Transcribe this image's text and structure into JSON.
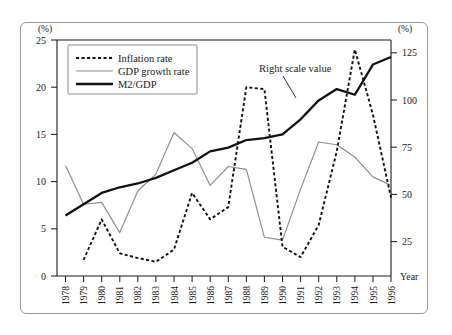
{
  "chart_data": {
    "type": "line",
    "title": "",
    "xlabel": "Year",
    "ylabel_left": "(%)",
    "ylabel_right": "(%)",
    "grid": false,
    "legend_position": "top-left",
    "x": [
      1978,
      1979,
      1980,
      1981,
      1982,
      1983,
      1984,
      1985,
      1986,
      1987,
      1988,
      1989,
      1990,
      1991,
      1992,
      1993,
      1994,
      1995,
      1996
    ],
    "categories": [
      "1978",
      "1979",
      "1980",
      "1981",
      "1982",
      "1983",
      "1984",
      "1985",
      "1986",
      "1987",
      "1988",
      "1989",
      "1990",
      "1991",
      "1992",
      "1993",
      "1994",
      "1995",
      "1996"
    ],
    "ylim_left": [
      0,
      25
    ],
    "ylim_right": [
      0,
      125
    ],
    "yticks_left": [
      0,
      5,
      10,
      15,
      20,
      25
    ],
    "yticks_right": [
      0,
      25,
      50,
      75,
      100,
      125
    ],
    "series": [
      {
        "name": "Inflation rate",
        "axis": "left",
        "style": "dotted",
        "color": "#111111",
        "values": [
          null,
          1.7,
          6.0,
          2.4,
          1.9,
          1.5,
          2.8,
          8.8,
          6.0,
          7.3,
          20.0,
          19.8,
          3.1,
          2.0,
          5.4,
          13.2,
          24.0,
          17.1,
          8.3
        ]
      },
      {
        "name": "GDP growth rate",
        "axis": "left",
        "style": "thin-solid",
        "color": "#8c8c8c",
        "values": [
          11.7,
          7.6,
          7.8,
          4.6,
          9.0,
          10.8,
          15.2,
          13.5,
          9.6,
          11.6,
          11.3,
          4.1,
          3.8,
          9.2,
          14.2,
          13.9,
          12.6,
          10.5,
          9.6
        ]
      },
      {
        "name": "M2/GDP",
        "axis": "right",
        "style": "thick-solid",
        "color": "#111111",
        "values": [
          32,
          38,
          44,
          47,
          49,
          52,
          56,
          60,
          66,
          68,
          72,
          73,
          75,
          83,
          93,
          99,
          96,
          112,
          116
        ]
      }
    ],
    "annotations": [
      {
        "text": "Right scale value",
        "points_to_series": "M2/GDP",
        "points_to_x": 1990
      }
    ]
  },
  "axes": {
    "left_unit": "(%)",
    "right_unit": "(%)",
    "x_axis_label": "Year",
    "left_ticks": [
      "25",
      "20",
      "15",
      "10",
      "5",
      "0"
    ],
    "right_ticks": [
      "125",
      "100",
      "75",
      "50",
      "25"
    ],
    "year_labels": [
      "1978",
      "1979",
      "1980",
      "1981",
      "1982",
      "1983",
      "1984",
      "1985",
      "1986",
      "1987",
      "1988",
      "1989",
      "1990",
      "1991",
      "1992",
      "1993",
      "1994",
      "1995",
      "1996"
    ]
  },
  "legend": {
    "items": [
      {
        "label": "Inflation rate",
        "style": "dotted"
      },
      {
        "label": "GDP growth rate",
        "style": "thin-solid"
      },
      {
        "label": "M2/GDP",
        "style": "thick-solid"
      }
    ]
  },
  "annotation": {
    "right_scale_value": "Right scale value"
  }
}
